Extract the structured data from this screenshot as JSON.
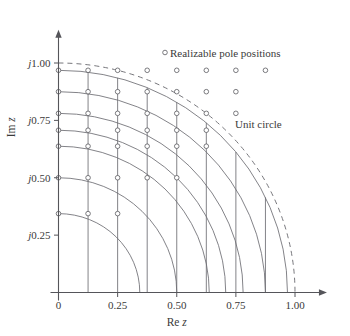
{
  "chart_data": {
    "type": "scatter",
    "title": "",
    "xlabel": "Re z",
    "ylabel": "Im z",
    "xlim": [
      0,
      1.08
    ],
    "ylim": [
      0,
      1.12
    ],
    "grid": false,
    "legend_position": "top-right",
    "x_ticks": [
      {
        "value": 0,
        "label": "0"
      },
      {
        "value": 0.25,
        "label": "0.25"
      },
      {
        "value": 0.5,
        "label": "0.50"
      },
      {
        "value": 0.75,
        "label": "0.75"
      },
      {
        "value": 1.0,
        "label": "1.00"
      }
    ],
    "y_ticks": [
      {
        "value": 0.25,
        "label": "j0.25"
      },
      {
        "value": 0.5,
        "label": "j0.50"
      },
      {
        "value": 0.75,
        "label": "j0.75"
      },
      {
        "value": 1.0,
        "label": "j1.00"
      }
    ],
    "annotations": [
      {
        "name": "unit-circle",
        "text": "Unit circle",
        "x": 0.8,
        "y": 0.79
      },
      {
        "name": "legend",
        "text": "Realizable pole positions",
        "x": 0.5,
        "y": 1.07
      }
    ],
    "unit_circle_radius": 1.0,
    "real_grid_values": [
      0,
      0.125,
      0.25,
      0.375,
      0.5,
      0.625,
      0.75,
      0.875
    ],
    "radius_grid_values": [
      0.3437,
      0.5,
      0.6374,
      0.7071,
      0.7806,
      0.875,
      0.9682
    ],
    "series": [
      {
        "name": "Realizable pole positions",
        "marker": "open-circle",
        "points": [
          [
            0,
            0.3437
          ],
          [
            0.125,
            0.3437
          ],
          [
            0.25,
            0.3437
          ],
          [
            0,
            0.5
          ],
          [
            0.125,
            0.5
          ],
          [
            0.25,
            0.5
          ],
          [
            0.375,
            0.5
          ],
          [
            0.5,
            0.5
          ],
          [
            0,
            0.6374
          ],
          [
            0.125,
            0.6374
          ],
          [
            0.25,
            0.6374
          ],
          [
            0.375,
            0.6374
          ],
          [
            0.5,
            0.6374
          ],
          [
            0.625,
            0.6374
          ],
          [
            0,
            0.7071
          ],
          [
            0.125,
            0.7071
          ],
          [
            0.25,
            0.7071
          ],
          [
            0.375,
            0.7071
          ],
          [
            0.5,
            0.7071
          ],
          [
            0.625,
            0.7071
          ],
          [
            0,
            0.7806
          ],
          [
            0.125,
            0.7806
          ],
          [
            0.25,
            0.7806
          ],
          [
            0.375,
            0.7806
          ],
          [
            0.5,
            0.7806
          ],
          [
            0.625,
            0.7806
          ],
          [
            0.75,
            0.7806
          ],
          [
            0,
            0.875
          ],
          [
            0.125,
            0.875
          ],
          [
            0.25,
            0.875
          ],
          [
            0.375,
            0.875
          ],
          [
            0.5,
            0.875
          ],
          [
            0.625,
            0.875
          ],
          [
            0.75,
            0.875
          ],
          [
            0,
            0.9682
          ],
          [
            0.125,
            0.9682
          ],
          [
            0.25,
            0.9682
          ],
          [
            0.375,
            0.9682
          ],
          [
            0.5,
            0.9682
          ],
          [
            0.625,
            0.9682
          ],
          [
            0.75,
            0.9682
          ],
          [
            0.875,
            0.9682
          ]
        ]
      }
    ]
  },
  "axes": {
    "x_title": "Re z",
    "x_title_prefix": "Re ",
    "x_title_var": "z",
    "y_title": "Im z",
    "y_title_prefix": "Im ",
    "y_title_var": "z"
  },
  "labels": {
    "x0": "0",
    "x25": "0.25",
    "x50": "0.50",
    "x75": "0.75",
    "x100": "1.00",
    "y25_j": "j",
    "y25_n": "0.25",
    "y50_j": "j",
    "y50_n": "0.50",
    "y75_j": "j",
    "y75_n": "0.75",
    "y100_j": "j",
    "y100_n": "1.00",
    "legend_text": "Realizable pole positions",
    "unit_circle_text": "Unit circle"
  },
  "colors": {
    "ink": "#3a3a3a",
    "grid": "#6d6d72",
    "axis": "#55555a",
    "marker_fill": "#ffffff",
    "background": "#ffffff"
  }
}
